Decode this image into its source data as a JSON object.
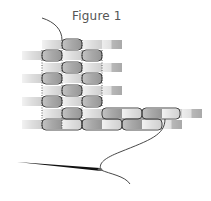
{
  "figure": {
    "title": "Figure 1"
  },
  "colors": {
    "bead_light": "#e6e6e6",
    "bead_mid": "#bdbdbd",
    "bead_dark": "#9a9a9a",
    "thread": "#333333",
    "needle": "#111111",
    "title": "#555555"
  },
  "rows": [
    {
      "start_x": 42,
      "y": 40,
      "count": 4
    },
    {
      "start_x": 22,
      "y": 51,
      "count": 5
    },
    {
      "start_x": 42,
      "y": 63,
      "count": 4
    },
    {
      "start_x": 22,
      "y": 74,
      "count": 5
    },
    {
      "start_x": 42,
      "y": 86,
      "count": 4
    },
    {
      "start_x": 22,
      "y": 97,
      "count": 5
    },
    {
      "start_x": 42,
      "y": 109,
      "count": 8
    },
    {
      "start_x": 22,
      "y": 120,
      "count": 8
    }
  ],
  "needle": {
    "tip": [
      17,
      162
    ],
    "eye": [
      101,
      170
    ]
  }
}
